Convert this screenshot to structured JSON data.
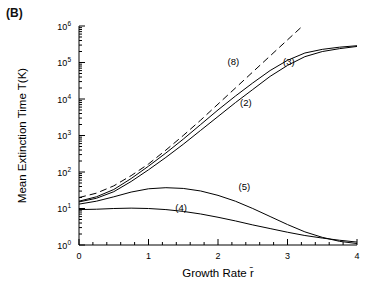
{
  "panel": {
    "label": "(B)"
  },
  "chart_data": {
    "type": "line",
    "title": "",
    "xlabel": "Growth Rate r̄",
    "ylabel": "Mean Extinction Time T(K)",
    "xlim": [
      0,
      4
    ],
    "ylim_log10": [
      0,
      6
    ],
    "yscale": "log",
    "xticks": [
      0,
      1,
      2,
      3,
      4
    ],
    "xticklabels": [
      "0",
      "1",
      "2",
      "3",
      "4"
    ],
    "yticks_log10": [
      0,
      1,
      2,
      3,
      4,
      5,
      6
    ],
    "yticklabels": [
      "10⁰",
      "10¹",
      "10²",
      "10³",
      "10⁴",
      "10⁵",
      "10⁶"
    ],
    "ytick_mantissas": [
      "10",
      "10",
      "10",
      "10",
      "10",
      "10",
      "10"
    ],
    "ytick_exponents": [
      "0",
      "1",
      "2",
      "3",
      "4",
      "5",
      "6"
    ],
    "grid": false,
    "legend": "inline curve labels",
    "annotations": [
      {
        "text": "(8)",
        "x": 2.22,
        "y_log10": 4.92
      },
      {
        "text": "(3)",
        "x": 3.02,
        "y_log10": 4.92
      },
      {
        "text": "(2)",
        "x": 2.4,
        "y_log10": 3.82
      },
      {
        "text": "(5)",
        "x": 2.38,
        "y_log10": 1.52
      },
      {
        "text": "(4)",
        "x": 1.47,
        "y_log10": 0.92
      }
    ],
    "series": [
      {
        "name": "(8)",
        "style": "dashed",
        "x": [
          0.0,
          0.25,
          0.5,
          0.75,
          1.0,
          1.25,
          1.5,
          1.75,
          2.0,
          2.25,
          2.5,
          2.75,
          3.0,
          3.2
        ],
        "y_log10": [
          1.3,
          1.42,
          1.62,
          1.9,
          2.22,
          2.6,
          3.0,
          3.42,
          3.86,
          4.3,
          4.74,
          5.18,
          5.62,
          5.97
        ]
      },
      {
        "name": "(3)",
        "style": "solid",
        "x": [
          0.0,
          0.25,
          0.5,
          0.75,
          1.0,
          1.25,
          1.5,
          1.75,
          2.0,
          2.25,
          2.5,
          2.75,
          3.0,
          3.25,
          3.5,
          3.75,
          4.0
        ],
        "y_log10": [
          1.2,
          1.32,
          1.52,
          1.82,
          2.16,
          2.52,
          2.9,
          3.3,
          3.7,
          4.08,
          4.44,
          4.78,
          5.06,
          5.26,
          5.36,
          5.42,
          5.46
        ]
      },
      {
        "name": "(2)",
        "style": "solid",
        "x": [
          0.0,
          0.25,
          0.5,
          0.75,
          1.0,
          1.25,
          1.5,
          1.75,
          2.0,
          2.25,
          2.5,
          2.75,
          3.0,
          3.25,
          3.5,
          3.75,
          4.0
        ],
        "y_log10": [
          1.18,
          1.28,
          1.46,
          1.74,
          2.06,
          2.4,
          2.76,
          3.14,
          3.52,
          3.9,
          4.26,
          4.62,
          4.92,
          5.16,
          5.3,
          5.38,
          5.44
        ]
      },
      {
        "name": "(5)",
        "style": "solid",
        "x": [
          0.0,
          0.25,
          0.5,
          0.75,
          1.0,
          1.25,
          1.5,
          1.75,
          2.0,
          2.25,
          2.5,
          2.75,
          3.0,
          3.25,
          3.5,
          3.75,
          4.0
        ],
        "y_log10": [
          1.12,
          1.2,
          1.32,
          1.45,
          1.54,
          1.57,
          1.55,
          1.48,
          1.36,
          1.2,
          1.0,
          0.78,
          0.56,
          0.36,
          0.21,
          0.1,
          0.04
        ]
      },
      {
        "name": "(4)",
        "style": "solid",
        "x": [
          0.0,
          0.25,
          0.5,
          0.75,
          1.0,
          1.25,
          1.5,
          1.75,
          2.0,
          2.25,
          2.5,
          2.75,
          3.0,
          3.25,
          3.5,
          3.75,
          4.0
        ],
        "y_log10": [
          0.97,
          0.98,
          1.0,
          1.01,
          1.0,
          0.97,
          0.92,
          0.85,
          0.76,
          0.66,
          0.55,
          0.45,
          0.35,
          0.26,
          0.19,
          0.13,
          0.08
        ]
      }
    ]
  }
}
